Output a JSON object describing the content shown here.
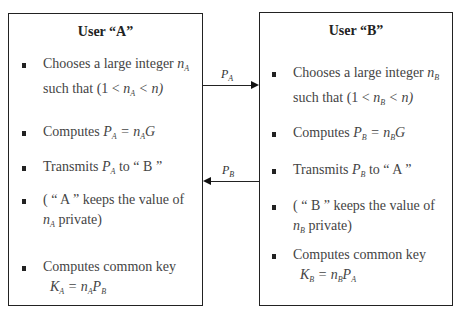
{
  "userA": {
    "title": "User “A”",
    "steps": [
      {
        "lines": [
          "Chooses a large integer",
          "such that"
        ],
        "var": "n",
        "sub": "A",
        "cond_pre": "(1 < ",
        "cond_var": "n",
        "cond_sub": "A",
        "cond_post": " < n)"
      },
      {
        "text": "Computes",
        "lhs": "P",
        "lhs_sub": "A",
        "rhs": " = n",
        "rhs_sub": "A",
        "rhs_tail": "G"
      },
      {
        "text": "Transmits",
        "var": "P",
        "sub": "A",
        "tail": "to “ B ”"
      },
      {
        "pre": "( “ A ” keeps the value of",
        "var": "n",
        "sub": "A",
        "tail": "private)"
      },
      {
        "text": "Computes common key",
        "lhs": "K",
        "lhs_sub": "A",
        "rhs": " = n",
        "rhs_sub": "A",
        "rhs_tail": "P",
        "rhs_tail_sub": "B"
      }
    ]
  },
  "userB": {
    "title": "User “B”",
    "steps": [
      {
        "lines": [
          "Chooses a large integer",
          "such that"
        ],
        "var": "n",
        "sub": "B",
        "cond_pre": "(1 < ",
        "cond_var": "n",
        "cond_sub": "B",
        "cond_post": " < n)"
      },
      {
        "text": "Computes",
        "lhs": "P",
        "lhs_sub": "B",
        "rhs": " = n",
        "rhs_sub": "B",
        "rhs_tail": "G"
      },
      {
        "text": "Transmits",
        "var": "P",
        "sub": "B",
        "tail": "to “ A ”"
      },
      {
        "pre": "( “ B ” keeps the value of",
        "var": "n",
        "sub": "B",
        "tail": "private)"
      },
      {
        "text": "Computes common key",
        "lhs": "K",
        "lhs_sub": "B",
        "rhs": " = n",
        "rhs_sub": "B",
        "rhs_tail": "P",
        "rhs_tail_sub": "A"
      }
    ]
  },
  "arrows": [
    {
      "label": "P",
      "label_sub": "A",
      "direction": "A-to-B"
    },
    {
      "label": "P",
      "label_sub": "B",
      "direction": "B-to-A"
    }
  ]
}
